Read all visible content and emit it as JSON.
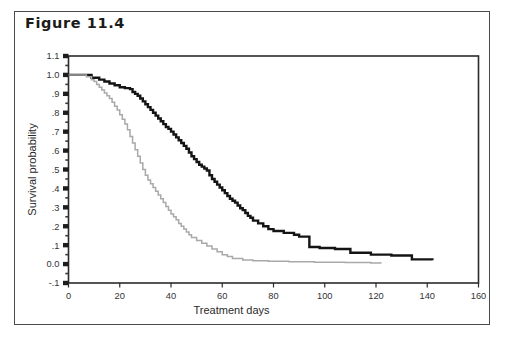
{
  "figure": {
    "title": "Figure 11.4",
    "border_color": "#4a4a4a"
  },
  "chart_data": {
    "type": "line",
    "title": "Figure 11.4",
    "xlabel": "Treatment days",
    "ylabel": "Survival probability",
    "xlim": [
      0,
      160
    ],
    "ylim": [
      -0.1,
      1.1
    ],
    "grid": false,
    "legend": "none",
    "xticks": [
      0,
      20,
      40,
      60,
      80,
      100,
      120,
      140,
      160
    ],
    "xtick_labels": [
      "0",
      "20",
      "40",
      "60",
      "80",
      "100",
      "120",
      "140",
      "160"
    ],
    "yticks": [
      1.1,
      1.0,
      0.9,
      0.8,
      0.7,
      0.6,
      0.5,
      0.4,
      0.3,
      0.2,
      0.1,
      0.0,
      -0.1
    ],
    "ytick_labels": [
      "1.1",
      "1.0",
      ".9",
      ".8",
      ".7",
      ".6",
      ".5",
      ".4",
      ".3",
      ".2",
      ".1",
      "0.0",
      "-.1"
    ],
    "y_minor_ticks": true,
    "step_style": "post",
    "series": [
      {
        "name": "group-black",
        "color": "#141414",
        "width": 2.4,
        "x": [
          0,
          6,
          9,
          12,
          14,
          16,
          18,
          20,
          22,
          24,
          25,
          26,
          27,
          28,
          29,
          30,
          31,
          32,
          33,
          34,
          35,
          36,
          37,
          38,
          39,
          40,
          41,
          42,
          43,
          44,
          45,
          46,
          47,
          48,
          49,
          50,
          51,
          52,
          53,
          54,
          55,
          56,
          57,
          58,
          59,
          60,
          61,
          62,
          63,
          64,
          65,
          66,
          67,
          68,
          69,
          70,
          71,
          72,
          74,
          76,
          78,
          80,
          84,
          88,
          90,
          94,
          98,
          104,
          110,
          118,
          124,
          126,
          134,
          142
        ],
        "y": [
          1.0,
          1.0,
          0.985,
          0.975,
          0.965,
          0.955,
          0.945,
          0.935,
          0.93,
          0.925,
          0.91,
          0.9,
          0.89,
          0.875,
          0.86,
          0.845,
          0.83,
          0.815,
          0.8,
          0.785,
          0.77,
          0.755,
          0.74,
          0.725,
          0.715,
          0.7,
          0.685,
          0.67,
          0.655,
          0.64,
          0.625,
          0.61,
          0.59,
          0.57,
          0.555,
          0.54,
          0.525,
          0.515,
          0.505,
          0.495,
          0.47,
          0.45,
          0.435,
          0.42,
          0.405,
          0.39,
          0.375,
          0.36,
          0.345,
          0.335,
          0.325,
          0.31,
          0.295,
          0.285,
          0.27,
          0.255,
          0.245,
          0.23,
          0.215,
          0.2,
          0.185,
          0.175,
          0.165,
          0.155,
          0.145,
          0.09,
          0.085,
          0.08,
          0.06,
          0.05,
          0.05,
          0.045,
          0.025,
          0.02
        ]
      },
      {
        "name": "group-gray",
        "color": "#a9a9a9",
        "width": 1.5,
        "x": [
          0,
          5,
          7,
          9,
          10,
          11,
          12,
          13,
          14,
          15,
          16,
          17,
          18,
          19,
          20,
          21,
          22,
          23,
          24,
          25,
          26,
          27,
          28,
          29,
          30,
          31,
          32,
          33,
          34,
          35,
          36,
          37,
          38,
          39,
          40,
          41,
          42,
          43,
          44,
          45,
          46,
          47,
          48,
          50,
          52,
          54,
          56,
          58,
          60,
          62,
          64,
          68,
          72,
          78,
          86,
          96,
          108,
          118,
          122
        ],
        "y": [
          1.0,
          1.0,
          0.99,
          0.975,
          0.965,
          0.95,
          0.935,
          0.92,
          0.905,
          0.89,
          0.875,
          0.855,
          0.835,
          0.815,
          0.79,
          0.765,
          0.74,
          0.71,
          0.675,
          0.64,
          0.605,
          0.57,
          0.535,
          0.5,
          0.47,
          0.445,
          0.425,
          0.405,
          0.385,
          0.365,
          0.345,
          0.325,
          0.305,
          0.285,
          0.265,
          0.25,
          0.235,
          0.215,
          0.2,
          0.185,
          0.17,
          0.155,
          0.14,
          0.125,
          0.11,
          0.095,
          0.08,
          0.065,
          0.05,
          0.04,
          0.03,
          0.022,
          0.018,
          0.015,
          0.012,
          0.01,
          0.008,
          0.006,
          0.005
        ]
      }
    ]
  }
}
